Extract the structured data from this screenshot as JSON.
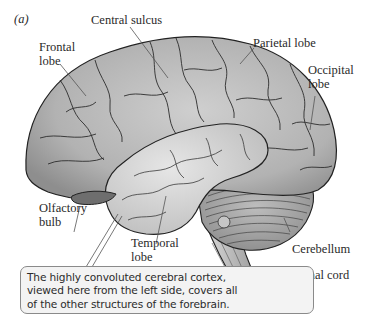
{
  "figure": {
    "panel_label": "(a)",
    "labels": {
      "central_sulcus": "Central sulcus",
      "frontal_lobe": "Frontal\nlobe",
      "parietal_lobe": "Parietal lobe",
      "occipital_lobe": "Occipital\nlobe",
      "olfactory_bulb": "Olfactory\nbulb",
      "temporal_lobe": "Temporal\nlobe",
      "cerebellum": "Cerebellum",
      "spinal_cord": "Spinal cord"
    },
    "callout": {
      "lines": [
        "The highly convoluted cerebral cortex,",
        "viewed here from the left side, covers all",
        "of the other structures of the forebrain."
      ]
    },
    "colors": {
      "cortex_fill": "#b9b9b9",
      "cortex_shadow": "#8f8f8f",
      "temporal_fill": "#d4d4d4",
      "cerebellum_fill": "#a9a9a9",
      "outline": "#222222",
      "callout_bg": "#f3f3f3"
    }
  }
}
